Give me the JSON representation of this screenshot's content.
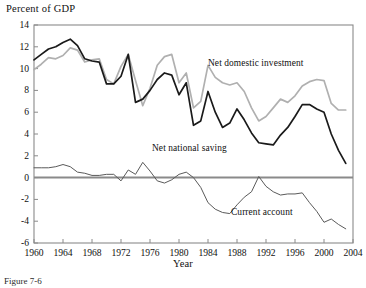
{
  "figure": {
    "ylabel_title": "Percent of  GDP",
    "xlabel_title": "Year",
    "caption": "Figure 7-6"
  },
  "series_labels": {
    "investment": "Net domestic investment",
    "saving": "Net national saving",
    "current_account": "Current account"
  },
  "colors": {
    "investment": "#b0b0b0",
    "saving": "#1a1a1a",
    "current_account": "#5a5a5a",
    "axis": "#8a8a8a",
    "zero_line": "#8a8a8a",
    "text": "#111111"
  },
  "chart_data": {
    "type": "line",
    "title": "Percent of  GDP",
    "xlabel": "Year",
    "ylabel": "Percent of  GDP",
    "xlim": [
      1960,
      2004
    ],
    "ylim": [
      -6,
      14
    ],
    "ytick_labels": [
      "14",
      "12",
      "10",
      "8",
      "6",
      "4",
      "2",
      "0",
      "-2",
      "-4",
      "-6"
    ],
    "ytick_values": [
      14,
      12,
      10,
      8,
      6,
      4,
      2,
      0,
      -2,
      -4,
      -6
    ],
    "xtick_labels": [
      "1960",
      "1964",
      "1968",
      "1972",
      "1976",
      "1980",
      "1984",
      "1988",
      "1992",
      "1996",
      "2000",
      "2004"
    ],
    "xtick_values": [
      1960,
      1964,
      1968,
      1972,
      1976,
      1980,
      1984,
      1988,
      1992,
      1996,
      2000,
      2004
    ],
    "grid": false,
    "legend_position": "inline-annotations",
    "x": [
      1960,
      1961,
      1962,
      1963,
      1964,
      1965,
      1966,
      1967,
      1968,
      1969,
      1970,
      1971,
      1972,
      1973,
      1974,
      1975,
      1976,
      1977,
      1978,
      1979,
      1980,
      1981,
      1982,
      1983,
      1984,
      1985,
      1986,
      1987,
      1988,
      1989,
      1990,
      1991,
      1992,
      1993,
      1994,
      1995,
      1996,
      1997,
      1998,
      1999,
      2000,
      2001,
      2002,
      2003
    ],
    "series": [
      {
        "name": "Net domestic investment",
        "color": "#b0b0b0",
        "values": [
          9.9,
          10.4,
          11.0,
          10.9,
          11.2,
          11.9,
          11.7,
          10.6,
          10.8,
          10.9,
          9.0,
          8.6,
          10.2,
          11.3,
          8.9,
          6.6,
          8.2,
          10.3,
          11.1,
          11.3,
          8.7,
          9.6,
          6.4,
          7.0,
          10.3,
          9.2,
          8.7,
          8.5,
          8.7,
          7.9,
          6.4,
          5.2,
          5.6,
          6.4,
          7.2,
          6.9,
          7.5,
          8.4,
          8.8,
          9.0,
          8.9,
          6.8,
          6.2,
          6.2
        ]
      },
      {
        "name": "Net national saving",
        "color": "#1a1a1a",
        "values": [
          10.8,
          11.3,
          11.8,
          12.0,
          12.4,
          12.7,
          12.1,
          10.9,
          10.7,
          10.6,
          8.6,
          8.6,
          9.3,
          11.3,
          6.9,
          7.2,
          8.0,
          9.0,
          9.6,
          9.4,
          7.6,
          8.7,
          4.8,
          5.2,
          7.9,
          6.0,
          4.6,
          5.0,
          6.3,
          5.3,
          4.1,
          3.2,
          3.1,
          3.0,
          3.9,
          4.6,
          5.6,
          6.7,
          6.7,
          6.3,
          6.0,
          4.0,
          2.5,
          1.3
        ]
      },
      {
        "name": "Current account",
        "color": "#5a5a5a",
        "values": [
          0.9,
          0.9,
          0.9,
          1.0,
          1.2,
          1.0,
          0.5,
          0.4,
          0.2,
          0.2,
          0.3,
          0.3,
          -0.3,
          0.7,
          0.3,
          1.4,
          0.6,
          -0.3,
          -0.5,
          -0.2,
          0.3,
          0.5,
          0.0,
          -0.9,
          -2.3,
          -2.9,
          -3.2,
          -3.3,
          -2.5,
          -1.8,
          -1.3,
          0.1,
          -0.8,
          -1.3,
          -1.6,
          -1.5,
          -1.5,
          -1.4,
          -2.3,
          -3.1,
          -4.1,
          -3.8,
          -4.3,
          -4.7
        ]
      }
    ]
  }
}
